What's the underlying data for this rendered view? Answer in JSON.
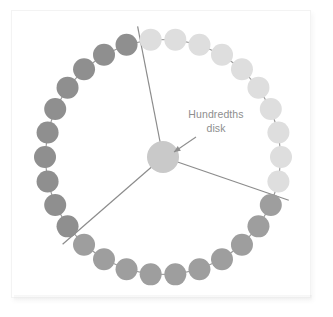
{
  "figure": {
    "title_label": "Hundredths\ndisk",
    "label_line1": "Hundredths",
    "label_line2": "disk",
    "background_color": "#ffffff",
    "card_border_color": "#f3f3f3",
    "label_color": "#8e8e8e",
    "arrow_color": "#8e8e8e",
    "divider_color": "#8c8c8c",
    "connector_color": "#9a9a9a",
    "center_disk": {
      "name": "hundredths-disk-hub",
      "cx": 163,
      "cy": 157,
      "r": 16,
      "color": "#c9c9c9"
    },
    "ring": {
      "cx": 163,
      "cy": 157,
      "radius": 118,
      "bead_count": 30,
      "bead_radius": 11,
      "start_angle_deg": -96
    },
    "sectors": [
      {
        "name": "sector-light",
        "label": "light sector",
        "bead_color": "#dedede",
        "bead_count": 10,
        "start_index": 0
      },
      {
        "name": "sector-medium",
        "label": "medium sector",
        "bead_color": "#9e9e9e",
        "bead_count": 10,
        "start_index": 10
      },
      {
        "name": "sector-dark",
        "label": "dark sector",
        "bead_color": "#8f8f8f",
        "bead_count": 10,
        "start_index": 20
      }
    ],
    "dividers": [
      {
        "name": "divider-top",
        "angle_deg": -101,
        "inner": 0,
        "outer": 133
      },
      {
        "name": "divider-lower-right",
        "angle_deg": 19,
        "inner": 0,
        "outer": 133
      },
      {
        "name": "divider-lower-left",
        "angle_deg": 139,
        "inner": 0,
        "outer": 133
      }
    ],
    "annotation_arrow": {
      "name": "label-pointer-arrow",
      "from_x": 196,
      "from_y": 137,
      "to_x": 174,
      "to_y": 152
    }
  },
  "chart_data": {
    "type": "pie",
    "title": "Hundredths disk",
    "categories": [
      "Sector 1",
      "Sector 2",
      "Sector 3"
    ],
    "values": [
      10,
      10,
      10
    ],
    "total_beads": 30,
    "note": "Ring of beads divided into three equal sectors by radial lines"
  }
}
